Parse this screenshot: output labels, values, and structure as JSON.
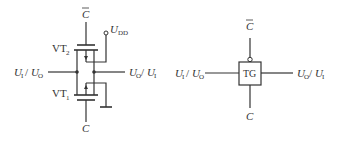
{
  "diagram": {
    "left_circuit": {
      "title": "CMOS transmission gate",
      "control_top": {
        "label": "C",
        "overbar": true
      },
      "control_bottom": {
        "label": "C",
        "overbar": false
      },
      "supply": {
        "label": "U",
        "sub": "DD"
      },
      "transistor_top": {
        "label": "VT",
        "sub": "2"
      },
      "transistor_bottom": {
        "label": "VT",
        "sub": "1"
      },
      "input": {
        "a": "U",
        "a_sub": "I",
        "sep": "/ ",
        "b": "U",
        "b_sub": "O"
      },
      "output": {
        "a": "U",
        "a_sub": "O",
        "sep": "/ ",
        "b": "U",
        "b_sub": "I"
      }
    },
    "right_symbol": {
      "box_label": "TG",
      "control_top": {
        "label": "C",
        "overbar": true
      },
      "control_bottom": {
        "label": "C",
        "overbar": false
      },
      "input": {
        "a": "U",
        "a_sub": "I",
        "sep": "/ ",
        "b": "U",
        "b_sub": "O"
      },
      "output": {
        "a": "U",
        "a_sub": "O",
        "sep": "/ ",
        "b": "U",
        "b_sub": "I"
      }
    },
    "colors": {
      "line": "#333333",
      "background": "#ffffff"
    }
  }
}
